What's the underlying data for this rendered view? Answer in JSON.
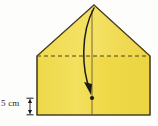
{
  "figure": {
    "name": "folded-paper-diagram",
    "background_color": "#fdfdfb",
    "paper": {
      "fill_color": "#f0da4b",
      "fill_color_light": "#f5e472",
      "outline_color": "#4a4026",
      "outline_width": 1.1,
      "points": "37,115 37,56 94,5 150,56 150,115",
      "apex_x": 94,
      "apex_y": 5,
      "left_x": 37,
      "right_x": 150,
      "shoulder_y": 56,
      "bottom_y": 115
    },
    "fold_line_dashed": {
      "name": "horizontal-fold-line",
      "color": "#4a4026",
      "y": 56,
      "x_start": 37,
      "x_end": 150,
      "dash": "4,3"
    },
    "centre_crease": {
      "name": "vertical-centre-crease",
      "color": "#6b5c32",
      "x": 92,
      "y_start": 10,
      "y_end": 115
    },
    "fold_arrow": {
      "name": "curved-fold-arrow",
      "color": "#1a1a1a",
      "start_x": 94,
      "start_y": 8,
      "end_x": 91,
      "end_y": 92,
      "control1_x": 80,
      "control1_y": 34,
      "control2_x": 82,
      "control2_y": 70
    },
    "fold_point": {
      "name": "fold-target-point",
      "color": "#1a1a1a",
      "x": 92,
      "y": 98,
      "radius": 2.1
    }
  },
  "measurement": {
    "label": "5 cm",
    "name": "height-measurement",
    "arrow_color": "#1a1a1a",
    "arrow_x": 30,
    "arrow_top_y": 98,
    "arrow_bottom_y": 115,
    "tick_half_width": 3.5
  }
}
